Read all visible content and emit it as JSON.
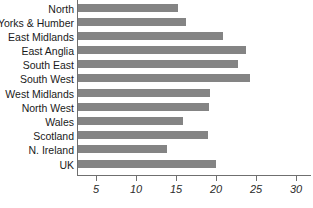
{
  "chart": {
    "title": "",
    "xlabel": "",
    "ylabel": ""
  },
  "chart_data": {
    "type": "bar",
    "orientation": "horizontal",
    "title": "",
    "xlabel": "",
    "ylabel": "",
    "xlim": [
      0,
      32
    ],
    "grid": false,
    "legend": null,
    "bar_color": "#848484",
    "axis_color": "#6f6f6f",
    "xticks": [
      5,
      10,
      15,
      20,
      25,
      30
    ],
    "xtick_labels": [
      "5",
      "10",
      "15",
      "20",
      "25",
      "30"
    ],
    "categories": [
      "North",
      "Yorks & Humber",
      "East Midlands",
      "East Anglia",
      "South East",
      "South West",
      "West Midlands",
      "North West",
      "Wales",
      "Scotland",
      "N. Ireland",
      "UK"
    ],
    "values": [
      15.2,
      16.2,
      20.9,
      23.8,
      22.8,
      24.2,
      19.2,
      19.1,
      15.9,
      19.0,
      13.9,
      20.0
    ]
  }
}
